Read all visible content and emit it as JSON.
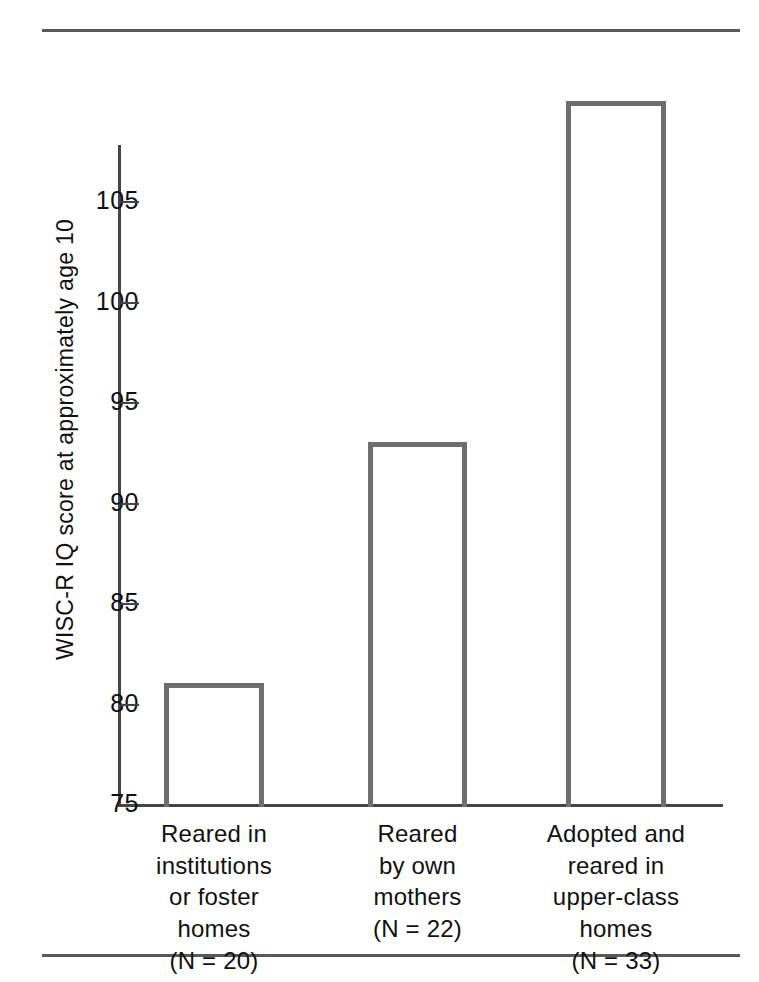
{
  "figure": {
    "y_axis_title": "WISC-R IQ score at approximately age 10",
    "rule_color": "#59595b",
    "bar_stroke_color": "#6e6e70",
    "axis_color": "#444446"
  },
  "chart_data": {
    "type": "bar",
    "title": "",
    "xlabel": "",
    "ylabel": "WISC-R IQ score at approximately age 10",
    "ylim": [
      75,
      113
    ],
    "yticks": [
      75,
      80,
      85,
      90,
      95,
      100,
      105
    ],
    "ytick_labels": [
      "75",
      "80",
      "85",
      "90",
      "95",
      "100",
      "105"
    ],
    "grid": false,
    "legend": null,
    "baseline": 75,
    "categories": [
      "Reared in institutions or foster homes (N = 20)",
      "Reared by own mothers (N = 22)",
      "Adopted and reared in upper-class homes (N = 33)"
    ],
    "values": [
      81,
      93,
      110
    ],
    "bars": [
      {
        "value": 81,
        "n": 20,
        "label_lines": [
          "Reared in",
          "institutions",
          "or foster",
          "homes",
          "(N = 20)"
        ]
      },
      {
        "value": 93,
        "n": 22,
        "label_lines": [
          "Reared",
          "by own",
          "mothers",
          "(N = 22)"
        ]
      },
      {
        "value": 110,
        "n": 33,
        "label_lines": [
          "Adopted and",
          "reared in",
          "upper-class",
          "homes",
          "(N = 33)"
        ]
      }
    ]
  }
}
